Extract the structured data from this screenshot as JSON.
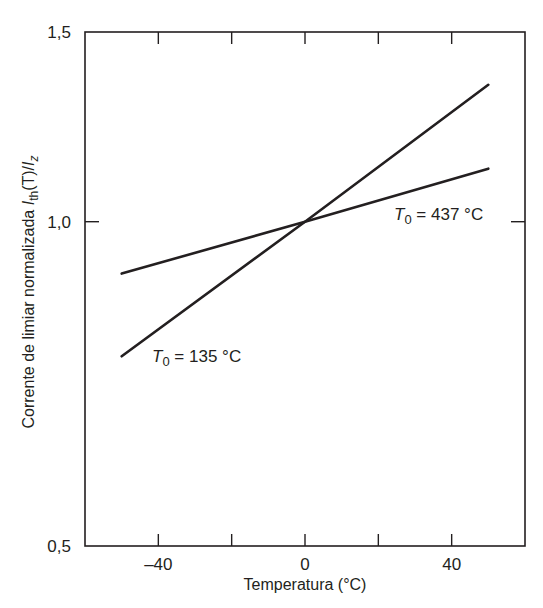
{
  "chart_data": {
    "type": "line",
    "title": "",
    "xlabel": "Temperatura (°C)",
    "ylabel": "Corrente de limiar normalizada I_th(T)/I_z",
    "ylabel_parts": {
      "main": "Corrente de limiar normalizada ",
      "I1": "I",
      "sub1": "th",
      "mid": "(T)/",
      "I2": "I",
      "sub2": "z"
    },
    "xlim": [
      -60,
      60
    ],
    "ylim": [
      0.5,
      1.5
    ],
    "yscale": "log",
    "grid": false,
    "legend": "none (inline annotations)",
    "x_ticks": [
      -40,
      -20,
      0,
      20,
      40
    ],
    "x_tick_labels": [
      "–40",
      "",
      "0",
      "",
      "40"
    ],
    "y_ticks": [
      0.5,
      1.0,
      1.5
    ],
    "y_tick_labels": [
      "0,5",
      "1,0",
      "1,5"
    ],
    "series": [
      {
        "name": "T0 = 135 °C",
        "x": [
          -50,
          0,
          50
        ],
        "y": [
          0.75,
          1.0,
          1.34
        ]
      },
      {
        "name": "T0 = 437 °C",
        "x": [
          -50,
          0,
          50
        ],
        "y": [
          0.895,
          1.0,
          1.12
        ]
      }
    ],
    "annotations": [
      {
        "text_T": "T",
        "text_sub": "0",
        "text_rest": " = 135 °C",
        "series": "T0 = 135 °C"
      },
      {
        "text_T": "T",
        "text_sub": "0",
        "text_rest": " = 437 °C",
        "series": "T0 = 437 °C"
      }
    ],
    "colors": {
      "line": "#231f20",
      "axis": "#231f20",
      "background": "#ffffff"
    }
  }
}
